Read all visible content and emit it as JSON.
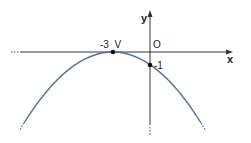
{
  "diagram": {
    "type": "parabola-graph",
    "axes": {
      "x_label": "x",
      "y_label": "y",
      "origin_label": "O"
    },
    "points": [
      {
        "name": "vertex",
        "label": "-3  V",
        "x": -3,
        "y": 0
      },
      {
        "name": "y-intercept",
        "label": "-1",
        "x": 0,
        "y": -1
      }
    ],
    "curve": {
      "equation": "y = -(1/9)(x+3)^2",
      "color": "#4a6fa5"
    },
    "colors": {
      "axis": "#333333",
      "curve": "#4a6fa5",
      "point": "#111111"
    }
  }
}
